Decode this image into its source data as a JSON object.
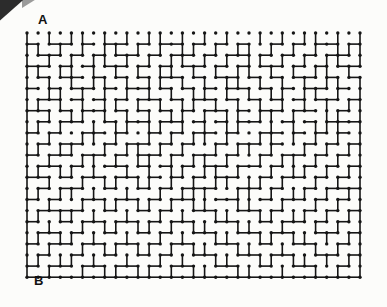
{
  "puzzle": {
    "type": "maze",
    "title": "Maze Puzzle",
    "start_label": "A",
    "end_label": "B",
    "start_position": "top-left",
    "end_position": "bottom-left",
    "ink_color": "#151515",
    "paper_color": "#fcfcfa",
    "grid": {
      "cols": 30,
      "rows": 22,
      "origin_x": 27,
      "origin_y": 33,
      "cell_size": 11.1,
      "dot_radius": 1.7,
      "wall_width": 1.6
    },
    "artifact": {
      "name": "scan-edge-corner",
      "color": "#1a1a1a",
      "position": "top-left"
    },
    "walls": {
      "h": [
        "000000000000000000000000000000",
        "101101011010110101010010101101",
        "011010101101011010110101010110",
        "110101011010101101010110101011",
        "010110101010110101101010110101",
        "101011010110101010110101011010",
        "011010101011010110101010101101",
        "110101101010101011010110110010",
        "010110010110110101011001010111",
        "101001101001010110100110101010",
        "010110010110101001011010010101",
        "101101101011010110100101101010",
        "011010011010101011011010010101",
        "110101101101010101100101101010",
        "010110010010101110011010010111",
        "101001101101011001100101101010",
        "011110010010100110011010010101",
        "100101101101011001100101101010",
        "011010010010100110011011001101",
        "101101101101011001100100110010",
        "010010010010100110011011001101",
        "101101101101011001100100110010",
        "111111111111111111111111111111"
      ],
      "v": [
        "1010110101011010101001010110101",
        "1101010110101011010110101010111",
        "1010101101010110101011010101101",
        "1101101010101101010110101011010",
        "1010101101011010101101010101101",
        "1011010101010101101010110110101",
        "1101010110101011010101010101011",
        "1010110101010110101101101001101",
        "1101001011011010101100101011101",
        "1010011010010101101001101010101",
        "1101100101101010010110100101011",
        "1010011010110101101001011010101",
        "1101101001010110110100101101011",
        "1010010110110101011011010010101",
        "1101101001001011100110101101011",
        "1010010110110101100110010010101",
        "1101101001001010011001101101011",
        "1010010110110101100110010010101",
        "1101101001001010011001101101011",
        "1010010110110101100110010010101",
        "1101101001001010011001101101011",
        "1010010110110101100110010010101"
      ]
    }
  }
}
